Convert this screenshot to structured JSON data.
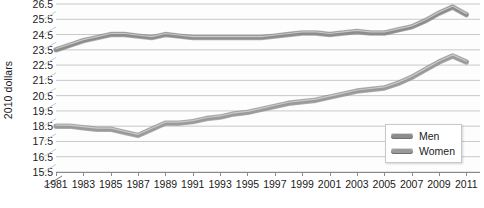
{
  "chart_data": {
    "type": "line",
    "title": "",
    "xlabel": "",
    "ylabel": "2010 dollars",
    "ylim": [
      15.5,
      26.5
    ],
    "ytick_step": 1.0,
    "yticks": [
      26.5,
      25.5,
      24.5,
      23.5,
      22.5,
      21.5,
      20.5,
      19.5,
      18.5,
      17.5,
      16.5,
      15.5
    ],
    "xlim": [
      1981,
      2012
    ],
    "xticks": [
      1981,
      1983,
      1985,
      1987,
      1989,
      1991,
      1993,
      1995,
      1997,
      1999,
      2001,
      2003,
      2005,
      2007,
      2009,
      2011
    ],
    "x": [
      1981,
      1982,
      1983,
      1984,
      1985,
      1986,
      1987,
      1988,
      1989,
      1990,
      1991,
      1992,
      1993,
      1994,
      1995,
      1996,
      1997,
      1998,
      1999,
      2000,
      2001,
      2002,
      2003,
      2004,
      2005,
      2006,
      2007,
      2008,
      2009,
      2010,
      2011
    ],
    "grid": true,
    "grid_axis": "y",
    "legend_position": "bottom-right",
    "style": "pseudo-3d",
    "series": [
      {
        "name": "Men",
        "color": "#8d8d8d",
        "values": [
          23.5,
          23.8,
          24.1,
          24.3,
          24.5,
          24.5,
          24.4,
          24.3,
          24.5,
          24.4,
          24.3,
          24.3,
          24.3,
          24.3,
          24.3,
          24.3,
          24.4,
          24.5,
          24.6,
          24.6,
          24.5,
          24.6,
          24.7,
          24.6,
          24.6,
          24.8,
          25.0,
          25.4,
          25.9,
          26.3,
          25.8
        ]
      },
      {
        "name": "Women",
        "color": "#9a9a9a",
        "values": [
          18.5,
          18.5,
          18.4,
          18.3,
          18.3,
          18.1,
          17.9,
          18.3,
          18.7,
          18.7,
          18.8,
          19.0,
          19.1,
          19.3,
          19.4,
          19.6,
          19.8,
          20.0,
          20.1,
          20.2,
          20.4,
          20.6,
          20.8,
          20.9,
          21.0,
          21.3,
          21.7,
          22.2,
          22.7,
          23.1,
          22.7
        ]
      }
    ]
  },
  "axes": {
    "y_title": "2010 dollars",
    "y_tick_labels": [
      "26.5",
      "25.5",
      "24.5",
      "23.5",
      "22.5",
      "21.5",
      "20.5",
      "19.5",
      "18.5",
      "17.5",
      "16.5",
      "15.5"
    ],
    "x_tick_labels": [
      "1981",
      "1983",
      "1985",
      "1987",
      "1989",
      "1991",
      "1993",
      "1995",
      "1997",
      "1999",
      "2001",
      "2003",
      "2005",
      "2007",
      "2009",
      "2011"
    ]
  },
  "legend": {
    "items": [
      {
        "label": "Men",
        "color": "#8d8d8d"
      },
      {
        "label": "Women",
        "color": "#9a9a9a"
      }
    ]
  },
  "colors": {
    "background": "#ffffff",
    "plot_floor": "#fdfdfd",
    "gridline": "#c9c9c9",
    "axis": "#8a8a8a",
    "text": "#1a1a1a",
    "men_line": "#8d8d8d",
    "women_line": "#9a9a9a",
    "legend_border": "#c8c8c8"
  }
}
